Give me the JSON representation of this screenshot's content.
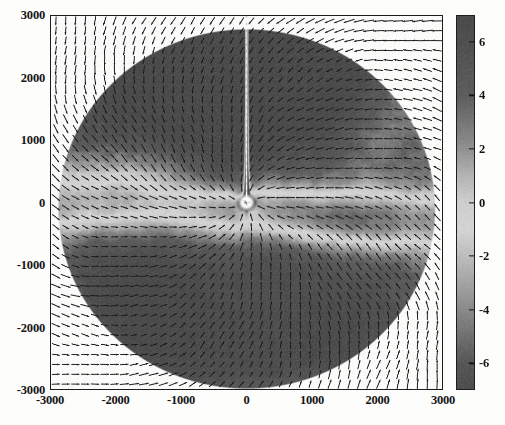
{
  "figure": {
    "kind": "vector-field-over-pseudocolor-map",
    "background_color": "#fdfdfc",
    "frame_color": "#1a1a1a"
  },
  "chart_data": {
    "type": "heatmap",
    "title": "",
    "subtitle": "",
    "xlabel": "",
    "ylabel": "",
    "colorbar_label": "",
    "xlim": [
      -3000,
      3000
    ],
    "ylim": [
      -3000,
      3000
    ],
    "clim": [
      -7,
      7
    ],
    "grid": false,
    "legend_position": "none",
    "overlay": {
      "type": "quiver",
      "description": "black arrow vector field covering the whole axes, arrows converge toward the central point source and wrap around it",
      "arrow_color": "#1d1d1d",
      "approx_columns": 40,
      "approx_rows": 38
    },
    "xticks": [
      -3000,
      -2000,
      -1000,
      0,
      1000,
      2000,
      3000
    ],
    "xticklabels": [
      "-3000",
      "-2000",
      "-1000",
      "0",
      "1000",
      "2000",
      "3000"
    ],
    "yticks": [
      -3000,
      -2000,
      -1000,
      0,
      1000,
      2000,
      3000
    ],
    "yticklabels": [
      "-3000",
      "-2000",
      "-1000",
      "0",
      "1000",
      "2000",
      "3000"
    ],
    "colorbar_ticks": [
      6,
      4,
      2,
      0,
      -2,
      -4,
      -6
    ],
    "colorbar_ticklabels": [
      "6",
      "4",
      "2",
      "0",
      "-2",
      "-4",
      "-6"
    ],
    "colormap": {
      "name": "diverging-gray",
      "description": "dark gray at the high end (+6), brightening to near white in the middle (around 0 to -1), darkening again toward the low end (-6)",
      "stops": [
        {
          "value": 7,
          "color": "#4a4a4a"
        },
        {
          "value": 6,
          "color": "#4e4e4e"
        },
        {
          "value": 4,
          "color": "#5c5c5c"
        },
        {
          "value": 2,
          "color": "#909090"
        },
        {
          "value": 1,
          "color": "#b4b4b4"
        },
        {
          "value": 0,
          "color": "#cecece"
        },
        {
          "value": -1,
          "color": "#d4d4d4"
        },
        {
          "value": -2,
          "color": "#bdbdbd"
        },
        {
          "value": -4,
          "color": "#8a8a8a"
        },
        {
          "value": -6,
          "color": "#565656"
        },
        {
          "value": -7,
          "color": "#4c4c4c"
        }
      ]
    },
    "features": [
      {
        "name": "data-disk",
        "shape": "circle",
        "center": [
          0,
          -100
        ],
        "radius": 2900,
        "note": "circular region of mapped data; outside the disk the map is blank white but still carries the arrow field"
      },
      {
        "name": "central-point-source",
        "shape": "bright-spot",
        "center": [
          0,
          0
        ],
        "radius_px": 9,
        "value": -7,
        "note": "small saturated white blob at the origin where the vector field converges"
      },
      {
        "name": "polar-jet",
        "shape": "vertical-streak",
        "x": 0,
        "y_range": [
          0,
          3000
        ],
        "value": -7,
        "note": "thin bright white vertical line running from the origin up to the top of the frame"
      },
      {
        "name": "upper-dark-lobe",
        "shape": "blob",
        "center": [
          -300,
          1700
        ],
        "value": 6,
        "note": "broad dark (high value) region filling the upper half of the disk"
      },
      {
        "name": "lower-left-dark-lobe",
        "shape": "blob",
        "center": [
          -1200,
          -1600
        ],
        "value": 6,
        "note": "dark high-value lobe in the lower-left of the disk"
      },
      {
        "name": "lower-right-dark-lobe",
        "shape": "blob",
        "center": [
          1300,
          -1900
        ],
        "value": 5,
        "note": "dark high-value lobe in the lower-right of the disk"
      },
      {
        "name": "equatorial-bright-band",
        "shape": "band",
        "center": [
          1400,
          -300
        ],
        "value": -3,
        "note": "light low-value band sweeping to the right of the origin"
      },
      {
        "name": "left-bright-band",
        "shape": "band",
        "center": [
          -1900,
          300
        ],
        "value": -2,
        "note": "light low-value band sweeping to the left of the origin"
      },
      {
        "name": "right-edge-wedge",
        "shape": "wedge",
        "center": [
          2200,
          1400
        ],
        "value": 0,
        "note": "lighter wedge-shaped feature near the upper-right limb of the disk"
      }
    ]
  },
  "axes": {
    "x_tick_labels": [
      "-3000",
      "-2000",
      "-1000",
      "0",
      "1000",
      "2000",
      "3000"
    ],
    "y_tick_labels": [
      "3000",
      "2000",
      "1000",
      "0",
      "-1000",
      "-2000",
      "-3000"
    ]
  },
  "colorbar": {
    "tick_labels": [
      "6",
      "4",
      "2",
      "0",
      "-2",
      "-4",
      "-6"
    ]
  }
}
